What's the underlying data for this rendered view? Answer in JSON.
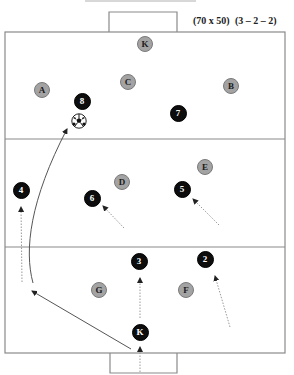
{
  "header": {
    "dimensions": "(70 x 50)",
    "formation": "(3 – 2 – 2)"
  },
  "colors": {
    "lines": "#8a8a8a",
    "attacker_fill": "#0d0d0d",
    "defender_fill": "#a3a3a3",
    "arrow": "#555555"
  },
  "field": {
    "left": 5,
    "top": 32,
    "right": 285,
    "bottom": 353,
    "zone_lines_y": [
      139,
      247
    ],
    "top_goal": {
      "x1": 109,
      "x2": 177,
      "y_top": 12
    },
    "bottom_goal": {
      "x1": 110,
      "x2": 177,
      "y_bottom": 373
    },
    "top_margin_line": {
      "x1": 85,
      "x2": 196,
      "y": 1
    }
  },
  "players": {
    "defenders": [
      {
        "label": "K",
        "x": 145,
        "y": 44
      },
      {
        "label": "A",
        "x": 42,
        "y": 90
      },
      {
        "label": "C",
        "x": 128,
        "y": 82
      },
      {
        "label": "B",
        "x": 231,
        "y": 86
      },
      {
        "label": "D",
        "x": 122,
        "y": 182
      },
      {
        "label": "E",
        "x": 205,
        "y": 167
      },
      {
        "label": "G",
        "x": 99,
        "y": 290
      },
      {
        "label": "F",
        "x": 186,
        "y": 290
      }
    ],
    "attackers": [
      {
        "label": "8",
        "x": 82,
        "y": 101
      },
      {
        "label": "7",
        "x": 178,
        "y": 113
      },
      {
        "label": "4",
        "x": 21,
        "y": 190
      },
      {
        "label": "6",
        "x": 92,
        "y": 198
      },
      {
        "label": "5",
        "x": 182,
        "y": 189
      },
      {
        "label": "3",
        "x": 139,
        "y": 261
      },
      {
        "label": "2",
        "x": 205,
        "y": 259
      },
      {
        "label": "K",
        "x": 140,
        "y": 332
      }
    ]
  },
  "ball": {
    "x": 79,
    "y": 121
  },
  "movements": [
    {
      "type": "run",
      "from": [
        124,
        228
      ],
      "to": [
        103,
        206
      ],
      "target": "6"
    },
    {
      "type": "run",
      "from": [
        219,
        225
      ],
      "to": [
        193,
        199
      ],
      "target": "5"
    },
    {
      "type": "run",
      "from": [
        22,
        282
      ],
      "to": [
        21,
        207
      ],
      "target": "4"
    },
    {
      "type": "run",
      "from": [
        140,
        318
      ],
      "to": [
        140,
        278
      ],
      "target": "3"
    },
    {
      "type": "run",
      "from": [
        230,
        327
      ],
      "to": [
        215,
        276
      ],
      "target": "2"
    },
    {
      "type": "run",
      "from": [
        140,
        372
      ],
      "to": [
        140,
        347
      ],
      "target": "K"
    }
  ],
  "passes": [
    {
      "type": "pass",
      "from": [
        131,
        349
      ],
      "to": [
        32,
        291
      ]
    },
    {
      "type": "pass-curve",
      "path": "M33,283 C24,250 30,200 67,129"
    }
  ]
}
